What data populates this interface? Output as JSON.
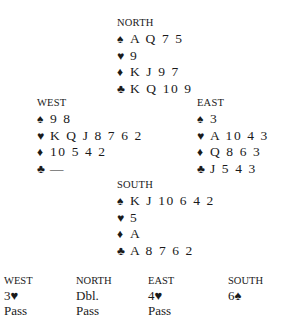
{
  "hands": {
    "north": {
      "label": "NORTH",
      "spades": "A Q 7 5",
      "hearts": "9",
      "diamonds": "K J 9 7",
      "clubs": "K Q 10 9"
    },
    "west": {
      "label": "WEST",
      "spades": "9 8",
      "hearts": "K Q J 8 7 6 2",
      "diamonds": "10 5 4 2",
      "clubs": "—"
    },
    "east": {
      "label": "EAST",
      "spades": "3",
      "hearts": "A 10 4 3",
      "diamonds": "Q 8 6 3",
      "clubs": "J 5 4 3"
    },
    "south": {
      "label": "SOUTH",
      "spades": "K J 10 6 4 2",
      "hearts": "5",
      "diamonds": "A",
      "clubs": "A 8 7 6 2"
    }
  },
  "suits": {
    "spades": "♠",
    "hearts": "♥",
    "diamonds": "♦",
    "clubs": "♣"
  },
  "auction": {
    "columns": [
      {
        "label": "WEST",
        "calls": [
          "3♥",
          "Pass"
        ]
      },
      {
        "label": "NORTH",
        "calls": [
          "Dbl.",
          "Pass"
        ]
      },
      {
        "label": "EAST",
        "calls": [
          "4♥",
          "Pass"
        ]
      },
      {
        "label": "SOUTH",
        "calls": [
          "6♠"
        ]
      }
    ]
  }
}
